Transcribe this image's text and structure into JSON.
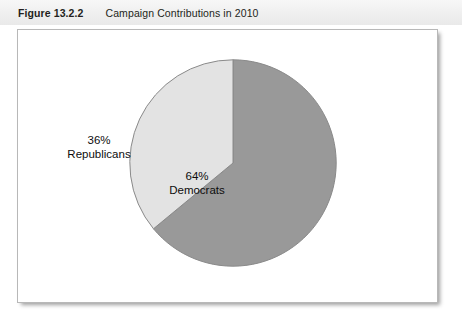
{
  "header": {
    "figure_number": "Figure 13.2.2",
    "caption": "Campaign Contributions in 2010"
  },
  "colors": {
    "democrats_slice": "#999999",
    "republicans_slice": "#e3e3e3",
    "slice_outline": "#8a8a8a",
    "header_band": "#efefef",
    "frame_border": "#b8b8b8",
    "text": "#231f20"
  },
  "chart_data": {
    "type": "pie",
    "title": "Campaign Contributions in 2010",
    "xlabel": "",
    "ylabel": "",
    "start_angle_deg": 0,
    "direction": "clockwise",
    "legend": "none",
    "grid": false,
    "categories": [
      "Democrats",
      "Republicans"
    ],
    "values": [
      64,
      36
    ],
    "unit": "%",
    "slices": [
      {
        "name": "Democrats",
        "value": 64,
        "percent_label": "64%",
        "name_label": "Democrats",
        "color": "#999999",
        "start_deg": 0,
        "end_deg": 230.4
      },
      {
        "name": "Republicans",
        "value": 36,
        "percent_label": "36%",
        "name_label": "Republicans",
        "color": "#e3e3e3",
        "start_deg": 230.4,
        "end_deg": 360
      }
    ]
  }
}
